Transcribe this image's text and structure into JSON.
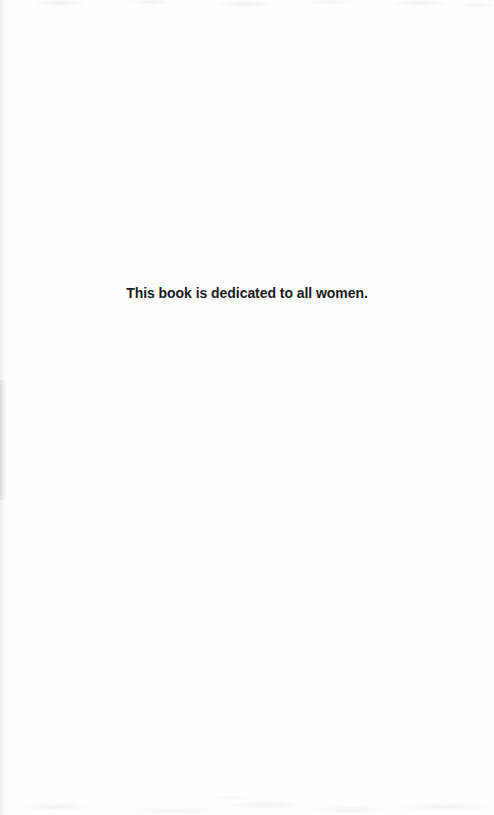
{
  "page": {
    "kind": "book-dedication-page",
    "background_color": "#fefefe",
    "dedication": {
      "text": "This book is dedicated to all women.",
      "color": "#1a1a1a",
      "weight": "bold",
      "alignment": "center"
    }
  }
}
